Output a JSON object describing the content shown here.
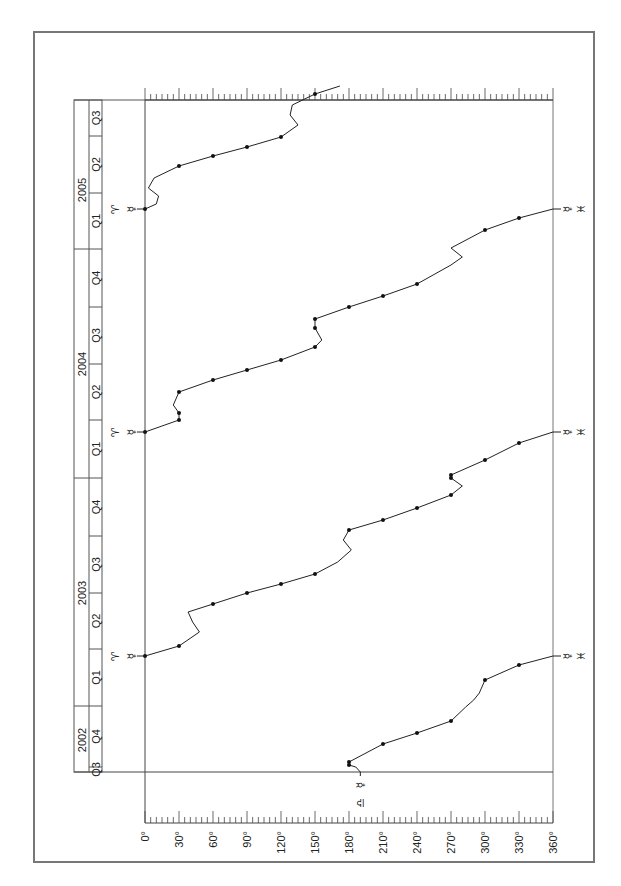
{
  "chart_data": {
    "type": "line",
    "title": "",
    "orientation": "rotated 90° (time runs vertically bottom→top, longitude horizontal)",
    "xlabel": "Ecliptic longitude",
    "ylabel": "Date (quarters)",
    "xlim": [
      0,
      360
    ],
    "x_ticks": [
      "0°",
      "30°",
      "60°",
      "90°",
      "120°",
      "150°",
      "180°",
      "210°",
      "240°",
      "270°",
      "300°",
      "330°",
      "360°"
    ],
    "time_axis": {
      "years": [
        {
          "label": "2002",
          "quarters": [
            "Q3",
            "Q4"
          ]
        },
        {
          "label": "2003",
          "quarters": [
            "Q1",
            "Q2",
            "Q3",
            "Q4"
          ]
        },
        {
          "label": "2004",
          "quarters": [
            "Q1",
            "Q2",
            "Q3",
            "Q4"
          ]
        },
        {
          "label": "2005",
          "quarters": [
            "Q1",
            "Q2",
            "Q3"
          ]
        }
      ]
    },
    "series": [
      {
        "name": "Mercury longitude",
        "color": "#222222",
        "markers": [
          {
            "position": "start",
            "longitude": 180,
            "glyphs": "☿ ♎"
          },
          {
            "position": "pisces-exit-2003",
            "longitude": 360,
            "glyphs": "☿ ♓"
          },
          {
            "position": "aries-entry-2003",
            "longitude": 0,
            "glyphs": "☿ ♈"
          },
          {
            "position": "pisces-exit-2004",
            "longitude": 360,
            "glyphs": "☿ ♓"
          },
          {
            "position": "aries-entry-2004",
            "longitude": 0,
            "glyphs": "☿ ♈"
          },
          {
            "position": "pisces-exit-2005",
            "longitude": 360,
            "glyphs": "☿ ♓"
          },
          {
            "position": "aries-entry-2005",
            "longitude": 0,
            "glyphs": "☿ ♈"
          }
        ],
        "segments": [
          {
            "label": "2002 Q3 – 2003 Q1",
            "points_lon": [
              180,
              180,
              210,
              240,
              270,
              300,
              330,
              360
            ]
          },
          {
            "label": "2003 Q1 – 2004 Q1",
            "points_lon": [
              0,
              30,
              60,
              90,
              120,
              150,
              180,
              210,
              240,
              270,
              270,
              300,
              330,
              360
            ]
          },
          {
            "label": "2004 Q1 – 2005 Q1",
            "points_lon": [
              0,
              30,
              30,
              60,
              90,
              120,
              150,
              150,
              180,
              210,
              240,
              270,
              300,
              330,
              360
            ]
          },
          {
            "label": "2005 Q1 – 2005 Q3",
            "points_lon": [
              0,
              30,
              60,
              90,
              120,
              150
            ]
          }
        ]
      }
    ],
    "grid": false,
    "legend": "none"
  },
  "labels": {
    "x_ticks": [
      "0°",
      "30°",
      "60°",
      "90°",
      "120°",
      "150°",
      "180°",
      "210°",
      "240°",
      "270°",
      "300°",
      "330°",
      "360°"
    ],
    "years": [
      "2002",
      "2003",
      "2004",
      "2005"
    ],
    "quarters_bottom_to_top": [
      "Q3",
      "Q4",
      "Q1",
      "Q2",
      "Q3",
      "Q4",
      "Q1",
      "Q2",
      "Q3",
      "Q4",
      "Q1",
      "Q2",
      "Q3"
    ],
    "glyph_mercury": "☿",
    "glyph_aries": "♈",
    "glyph_pisces": "♓",
    "glyph_libra": "♎"
  }
}
